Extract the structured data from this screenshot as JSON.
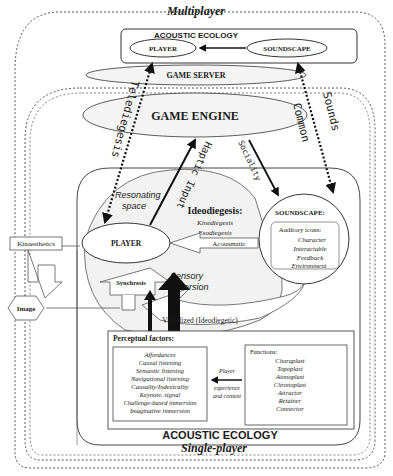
{
  "titles": {
    "multiplayer": "Multiplayer",
    "single_player": "Single-player",
    "acoustic_ecology_top": "ACOUSTIC ECOLOGY",
    "acoustic_ecology_bottom": "ACOUSTIC ECOLOGY"
  },
  "top_ecology": {
    "player": "PLAYER",
    "soundscape": "SOUNDSCAPE"
  },
  "layers": {
    "game_server": "GAME SERVER",
    "game_engine": "GAME ENGINE"
  },
  "arrow_labels": {
    "telediegesis": "Telediegesis",
    "common_sounds_1": "Common",
    "common_sounds_2": "Sounds",
    "haptic_input": "Haptic Input",
    "sociality": "Sociality"
  },
  "core": {
    "resonating_space_1": "Resonating",
    "resonating_space_2": "space",
    "player": "PLAYER",
    "kinaesthetics": "Kinaesthetics",
    "image": "Image",
    "synchresis": "Synchresis",
    "sensory_immersion_1": "Sensory",
    "sensory_immersion_2": "immersion",
    "visualized": "Visualized (Ideodiegetic)"
  },
  "ideodiegesis": {
    "title": "Ideodiegesis:",
    "items": [
      "Kinediegesis",
      "Exodiegesis"
    ],
    "acousmatic": "Acousmatic"
  },
  "soundscape": {
    "title": "SOUNDSCAPE:",
    "auditory_icons": "Auditory icons:",
    "items": [
      "Character",
      "Interactable",
      "Feedback",
      "Environment"
    ]
  },
  "perceptual": {
    "title": "Perceptual factors:",
    "items": [
      "Affordances",
      "Causal listening",
      "Semantic listening",
      "Navigational listening",
      "Causality/Indexicality",
      "Keynote, signal",
      "Challenge-based immersion",
      "Imaginative immersion"
    ]
  },
  "player_experience": {
    "line1": "Player",
    "line2": "experience",
    "line3": "and context"
  },
  "functions": {
    "title": "Functions:",
    "items": [
      "Choraplast",
      "Topoplast",
      "Aionoplast",
      "Chronoplast",
      "Attractor",
      "Retainer",
      "Connector"
    ]
  },
  "colors": {
    "stroke": "#1a1a1a",
    "dashed": "#555555",
    "background": "#ffffff",
    "layer_fill": "#f4f4f4"
  }
}
